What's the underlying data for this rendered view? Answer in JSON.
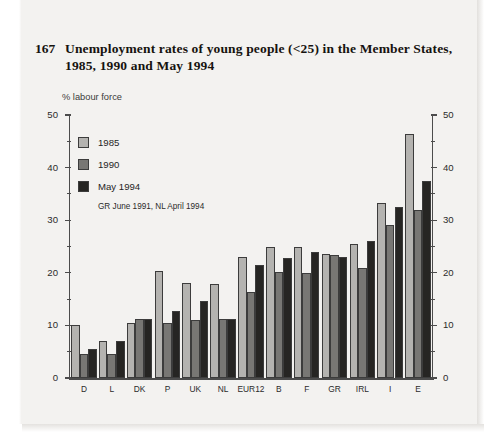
{
  "page": {
    "figure_number": "167",
    "title": "Unemployment rates of young people (<25) in the Member States, 1985, 1990 and May 1994"
  },
  "chart_data": {
    "type": "bar",
    "title": "Unemployment rates of young people (<25) in the Member States, 1985, 1990 and May 1994",
    "subtitle": "",
    "xlabel": "",
    "ylabel": "% labour force",
    "unit_label": "% labour force",
    "note": "GR June 1991, NL April 1994",
    "ylim": [
      0,
      50
    ],
    "yticks": [
      0,
      10,
      20,
      30,
      40,
      50
    ],
    "yticklabels": [
      "0",
      "10",
      "20",
      "30",
      "40",
      "50"
    ],
    "yminor_ticks": [
      5,
      15,
      25,
      35,
      45
    ],
    "right_axis": true,
    "right_yticklabels": [
      "0",
      "10",
      "20",
      "30",
      "40",
      "50"
    ],
    "grid": false,
    "legend_position": "upper-left",
    "categories": [
      "D",
      "L",
      "DK",
      "P",
      "UK",
      "NL",
      "EUR12",
      "B",
      "F",
      "GR",
      "IRL",
      "I",
      "E"
    ],
    "series": [
      {
        "name": "1985",
        "color": "#b4b3b0",
        "values": [
          10.0,
          7.0,
          10.5,
          20.3,
          18.0,
          17.8,
          23.0,
          25.0,
          25.0,
          23.5,
          25.5,
          33.3,
          46.4
        ]
      },
      {
        "name": "1990",
        "color": "#787774",
        "values": [
          4.6,
          4.5,
          11.3,
          10.5,
          11.0,
          11.2,
          16.3,
          20.2,
          20.0,
          23.3,
          21.0,
          29.0,
          32.0
        ]
      },
      {
        "name": "May 1994",
        "color": "#262523",
        "values": [
          5.6,
          7.0,
          11.2,
          12.8,
          14.6,
          11.2,
          21.5,
          22.8,
          24.0,
          23.0,
          26.0,
          32.5,
          37.5
        ]
      }
    ]
  },
  "legend": {
    "items": [
      {
        "label": "1985"
      },
      {
        "label": "1990"
      },
      {
        "label": "May 1994"
      }
    ],
    "note": "GR June 1991, NL April 1994"
  }
}
